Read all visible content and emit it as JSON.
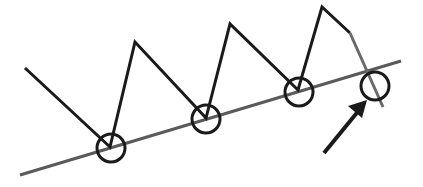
{
  "diagram": {
    "type": "trendline-breakdown",
    "colors": {
      "price_line": "#1a1a1a",
      "trend_line": "#5a5a5a",
      "breakdown_segment": "#6a6a6a",
      "circle": "#1a1a1a",
      "arrow": "#1a1a1a",
      "background": "#ffffff"
    },
    "trend_line": {
      "x1": 20,
      "y1": 175,
      "x2": 401,
      "y2": 61
    },
    "price_path": "25,68 110,147 135,42 206,118 230,24 298,90 322,7 350,33",
    "breakdown_path": "350,33 383,107",
    "touch_points": [
      {
        "cx": 111,
        "cy": 148,
        "r": 14
      },
      {
        "cx": 206,
        "cy": 119,
        "r": 14
      },
      {
        "cx": 299,
        "cy": 92,
        "r": 14
      },
      {
        "cx": 375,
        "cy": 86,
        "r": 14
      }
    ],
    "arrow": {
      "x1": 324,
      "y1": 153,
      "x2": 360,
      "y2": 109,
      "head": "367,100 348,106 362,118"
    }
  }
}
